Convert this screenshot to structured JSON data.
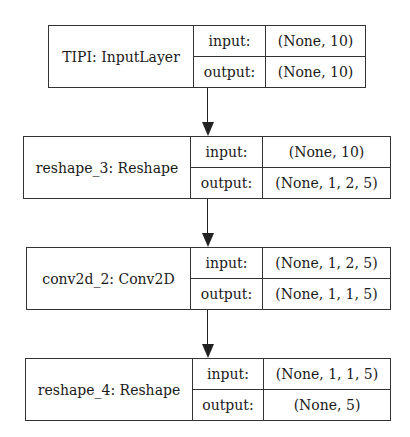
{
  "diagram": {
    "nodes": [
      {
        "name": "TIPI: InputLayer",
        "input_label": "input:",
        "input_value": "(None, 10)",
        "output_label": "output:",
        "output_value": "(None, 10)"
      },
      {
        "name": "reshape_3: Reshape",
        "input_label": "input:",
        "input_value": "(None, 10)",
        "output_label": "output:",
        "output_value": "(None, 1, 2, 5)"
      },
      {
        "name": "conv2d_2: Conv2D",
        "input_label": "input:",
        "input_value": "(None, 1, 2, 5)",
        "output_label": "output:",
        "output_value": "(None, 1, 1, 5)"
      },
      {
        "name": "reshape_4: Reshape",
        "input_label": "input:",
        "input_value": "(None, 1, 1, 5)",
        "output_label": "output:",
        "output_value": "(None, 5)"
      }
    ],
    "edges": [
      {
        "from": "TIPI: InputLayer",
        "to": "reshape_3: Reshape"
      },
      {
        "from": "reshape_3: Reshape",
        "to": "conv2d_2: Conv2D"
      },
      {
        "from": "conv2d_2: Conv2D",
        "to": "reshape_4: Reshape"
      }
    ]
  }
}
